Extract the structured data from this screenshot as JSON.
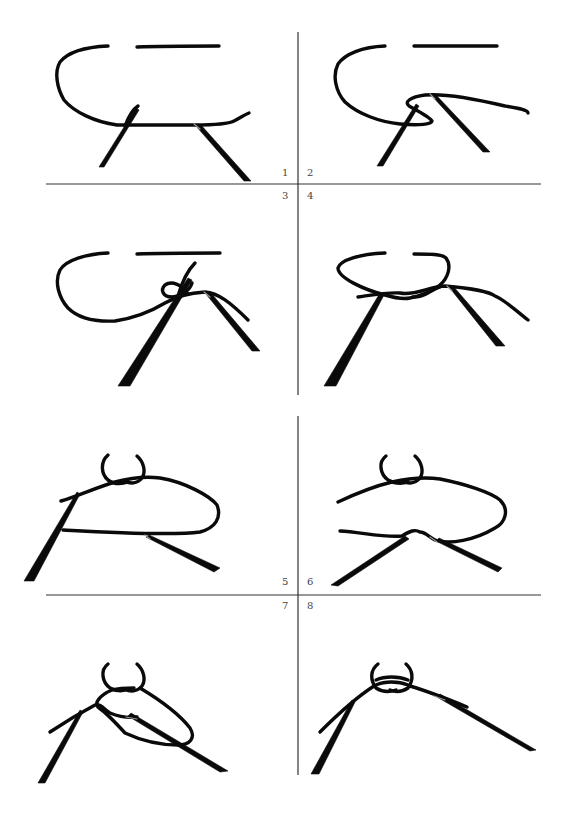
{
  "figure": {
    "colors": {
      "background": "#ffffff",
      "rope": "#0a0a0a",
      "needle": "#0a0a0a",
      "divider": "#333333",
      "label": "#444444"
    }
  },
  "steps": [
    {
      "number": "1",
      "label": "1"
    },
    {
      "number": "2",
      "label": "2"
    },
    {
      "number": "3",
      "label": "3"
    },
    {
      "number": "4",
      "label": "4"
    },
    {
      "number": "5",
      "label": "5"
    },
    {
      "number": "6",
      "label": "6"
    },
    {
      "number": "7",
      "label": "7"
    },
    {
      "number": "8",
      "label": "8"
    }
  ]
}
